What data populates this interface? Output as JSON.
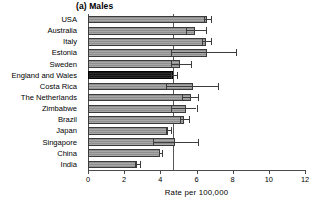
{
  "chart_data": {
    "type": "bar",
    "orientation": "horizontal",
    "title": "(a) Males",
    "xlabel": "Rate  per 100,000",
    "ylabel": "",
    "xlim": [
      0,
      12
    ],
    "xticks": [
      0,
      2,
      4,
      6,
      8,
      10,
      12
    ],
    "xticklabels": [
      "0",
      "2",
      "4",
      "6",
      "8",
      "10",
      "12"
    ],
    "grid": false,
    "legend": null,
    "reference_line": {
      "value": 4.7,
      "label": "England and Wales rate"
    },
    "highlight_category": "England and Wales",
    "categories": [
      "USA",
      "Australia",
      "Italy",
      "Estonia",
      "Sweden",
      "England and Wales",
      "Costa Rica",
      "The Netherlands",
      "Zimbabwe",
      "Brazil",
      "Japan",
      "Singapore",
      "China",
      "India"
    ],
    "values": [
      6.6,
      5.9,
      6.5,
      6.6,
      5.1,
      4.7,
      5.8,
      5.7,
      5.4,
      5.3,
      4.4,
      4.8,
      4.0,
      2.7
    ],
    "error_low": [
      6.4,
      5.4,
      6.3,
      4.6,
      4.6,
      4.6,
      4.3,
      5.2,
      4.6,
      5.1,
      4.3,
      3.6,
      3.9,
      2.6
    ],
    "error_high": [
      6.8,
      6.5,
      6.8,
      8.2,
      5.7,
      4.9,
      7.2,
      6.1,
      6.0,
      5.6,
      4.6,
      6.1,
      4.1,
      2.9
    ],
    "bars": [
      {
        "category": "USA",
        "value": 6.6,
        "ci_low": 6.4,
        "ci_high": 6.8,
        "highlight": false
      },
      {
        "category": "Australia",
        "value": 5.9,
        "ci_low": 5.4,
        "ci_high": 6.5,
        "highlight": false
      },
      {
        "category": "Italy",
        "value": 6.5,
        "ci_low": 6.3,
        "ci_high": 6.8,
        "highlight": false
      },
      {
        "category": "Estonia",
        "value": 6.6,
        "ci_low": 4.6,
        "ci_high": 8.2,
        "highlight": false
      },
      {
        "category": "Sweden",
        "value": 5.1,
        "ci_low": 4.6,
        "ci_high": 5.7,
        "highlight": false
      },
      {
        "category": "England and Wales",
        "value": 4.7,
        "ci_low": 4.6,
        "ci_high": 4.9,
        "highlight": true
      },
      {
        "category": "Costa Rica",
        "value": 5.8,
        "ci_low": 4.3,
        "ci_high": 7.2,
        "highlight": false
      },
      {
        "category": "The Netherlands",
        "value": 5.7,
        "ci_low": 5.2,
        "ci_high": 6.1,
        "highlight": false
      },
      {
        "category": "Zimbabwe",
        "value": 5.4,
        "ci_low": 4.6,
        "ci_high": 6.0,
        "highlight": false
      },
      {
        "category": "Brazil",
        "value": 5.3,
        "ci_low": 5.1,
        "ci_high": 5.6,
        "highlight": false
      },
      {
        "category": "Japan",
        "value": 4.4,
        "ci_low": 4.3,
        "ci_high": 4.6,
        "highlight": false
      },
      {
        "category": "Singapore",
        "value": 4.8,
        "ci_low": 3.6,
        "ci_high": 6.1,
        "highlight": false
      },
      {
        "category": "China",
        "value": 4.0,
        "ci_low": 3.9,
        "ci_high": 4.1,
        "highlight": false
      },
      {
        "category": "India",
        "value": 2.7,
        "ci_low": 2.6,
        "ci_high": 2.9,
        "highlight": false
      }
    ]
  },
  "colors": {
    "bar_fill": "#a0a0a0",
    "bar_edge": "#3a3a3a",
    "bar_highlight": "#1a1a1a",
    "axis": "#4a4a4a",
    "reference_line": "#555555",
    "background": "#ffffff",
    "text": "#000000"
  }
}
